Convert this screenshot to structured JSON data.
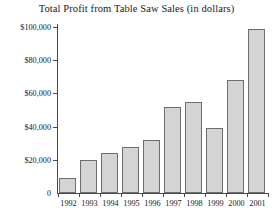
{
  "chart_data": {
    "type": "bar",
    "title": "Total Profit from Table Saw Sales (in dollars)",
    "xlabel": "",
    "ylabel": "",
    "categories": [
      "1992",
      "1993",
      "1994",
      "1995",
      "1996",
      "1997",
      "1998",
      "1999",
      "2000",
      "2001"
    ],
    "values": [
      9000,
      20000,
      24000,
      28000,
      32000,
      52000,
      55000,
      39000,
      68000,
      99000
    ],
    "ylim": [
      0,
      100000
    ],
    "ytick_values": [
      0,
      20000,
      40000,
      60000,
      80000,
      100000
    ],
    "ytick_labels": [
      "0",
      "$20,000",
      "$40,000",
      "$60,000",
      "$80,000",
      "$100,000"
    ],
    "grid": false,
    "legend": null,
    "bar_color": "#d4d4d4",
    "bar_border_color": "#6e6e6e",
    "axis_color": "#4a4a4a",
    "text_color": "#1a1a1a"
  }
}
